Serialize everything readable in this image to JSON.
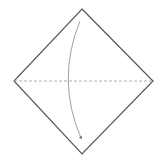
{
  "diagram": {
    "type": "origami-fold-step",
    "paper": {
      "shape": "square-on-point",
      "vertices": {
        "top": [
          82,
          9
        ],
        "right": [
          153,
          81
        ],
        "bottom": [
          82,
          154
        ],
        "left": [
          14,
          81
        ]
      },
      "stroke": "#555555",
      "fill": "#ffffff"
    },
    "fold_line": {
      "style": "valley-dashed",
      "from": [
        14,
        81
      ],
      "to": [
        153,
        81
      ],
      "stroke": "#999999"
    },
    "arrow": {
      "meaning": "fold-top-corner-down",
      "path": "M80 21 Q 56 80 81 138",
      "stroke": "#888888"
    }
  }
}
